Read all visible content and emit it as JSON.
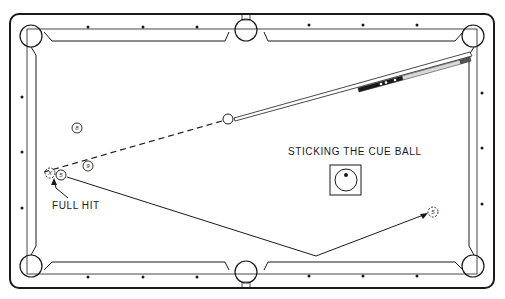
{
  "diagram": {
    "title": "STICKING THE CUE BALL",
    "annotation": "FULL HIT",
    "colors": {
      "ink": "#1a1a1a",
      "background": "#ffffff"
    },
    "balls": [
      {
        "id": "8",
        "label": "8",
        "x": 77,
        "y": 128,
        "style": "solid"
      },
      {
        "id": "9",
        "label": "9",
        "x": 88,
        "y": 166,
        "style": "solid"
      },
      {
        "id": "ghost",
        "label": "X",
        "x": 50,
        "y": 173,
        "style": "dashed"
      },
      {
        "id": "5",
        "label": "5",
        "x": 61,
        "y": 175,
        "style": "solid"
      },
      {
        "id": "5-final",
        "label": "5",
        "x": 433,
        "y": 212,
        "style": "dashed"
      },
      {
        "id": "cue",
        "label": "",
        "x": 228,
        "y": 119,
        "style": "solid"
      }
    ],
    "paths": {
      "cue_ball_path": "dashed line from cue ball to ghost ball",
      "object_ball_path": "5 ball banks off bottom rail to final position"
    },
    "cue_ball_diagram": {
      "hit_point": "center-top"
    }
  }
}
